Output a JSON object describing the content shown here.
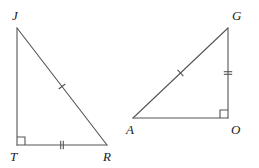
{
  "figure": {
    "type": "geometry-diagram",
    "width": 259,
    "height": 168,
    "background_color": "#ffffff",
    "stroke_color": "#555555",
    "label_color": "#1a1a1a",
    "stroke_width": 1.1
  },
  "triangles": [
    {
      "id": "triangle-jtr",
      "name": "triangle-JTR",
      "vertices": [
        {
          "name": "J",
          "label": "J",
          "x": 17,
          "y": 28,
          "label_x": 12,
          "label_y": 9
        },
        {
          "name": "T",
          "label": "T",
          "x": 17,
          "y": 145,
          "label_x": 10,
          "label_y": 150
        },
        {
          "name": "R",
          "label": "R",
          "x": 107,
          "y": 145,
          "label_x": 103,
          "label_y": 150
        }
      ],
      "sides": [
        {
          "name": "JT",
          "from": "J",
          "to": "T",
          "ticks": 0
        },
        {
          "name": "TR",
          "from": "T",
          "to": "R",
          "ticks": 2
        },
        {
          "name": "JR",
          "from": "J",
          "to": "R",
          "ticks": 1
        }
      ],
      "right_angle_at": "T",
      "right_angle_marker": {
        "x": 17,
        "y": 145,
        "size": 8,
        "dir_x": 1,
        "dir_y": -1
      }
    },
    {
      "id": "triangle-ago",
      "name": "triangle-AGO",
      "vertices": [
        {
          "name": "A",
          "label": "A",
          "x": 133,
          "y": 118,
          "label_x": 126,
          "label_y": 123
        },
        {
          "name": "G",
          "label": "G",
          "x": 228,
          "y": 28,
          "label_x": 232,
          "label_y": 9
        },
        {
          "name": "O",
          "label": "O",
          "x": 228,
          "y": 118,
          "label_x": 231,
          "label_y": 123
        }
      ],
      "sides": [
        {
          "name": "AO",
          "from": "A",
          "to": "O",
          "ticks": 0
        },
        {
          "name": "GO",
          "from": "G",
          "to": "O",
          "ticks": 2
        },
        {
          "name": "AG",
          "from": "A",
          "to": "G",
          "ticks": 1
        }
      ],
      "right_angle_at": "O",
      "right_angle_marker": {
        "x": 228,
        "y": 118,
        "size": 8,
        "dir_x": -1,
        "dir_y": -1
      }
    }
  ]
}
